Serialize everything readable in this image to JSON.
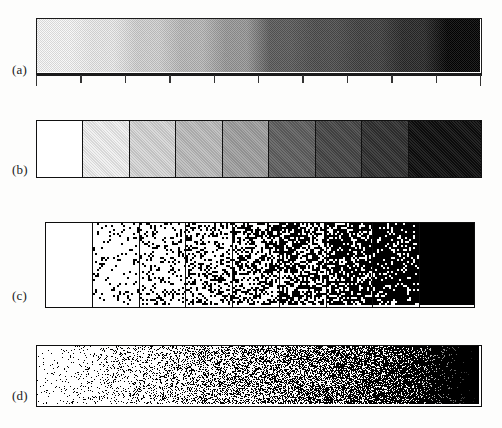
{
  "figure": {
    "kind": "halftone-ramp-comparison",
    "background_color": "#fdfdfc",
    "ink_color": "#0d0d0d",
    "paper_color": "#ffffff",
    "panels": [
      {
        "id": "a",
        "label": "(a)",
        "description": "continuous stepped gray ramp with tick axis",
        "x": 36,
        "y": 18,
        "width": 446,
        "height": 56,
        "has_axis": true,
        "has_cell_borders": false,
        "rendering": "stepped-gray",
        "steps": 10,
        "gray_levels": [
          232,
          222,
          200,
          178,
          150,
          96,
          84,
          72,
          52,
          18
        ],
        "axis": {
          "y_offset": 56,
          "line_thickness": 2,
          "tick_count": 11,
          "tick_length": 8,
          "tick_length_major": 11,
          "major_every": 1
        }
      },
      {
        "id": "b",
        "label": "(b)",
        "description": "nine discrete gray cells with black borders",
        "x": 36,
        "y": 120,
        "width": 446,
        "height": 58,
        "has_axis": false,
        "has_cell_borders": true,
        "rendering": "flat-gray-cells",
        "cells": 9,
        "gray_levels": [
          255,
          240,
          214,
          188,
          160,
          96,
          70,
          48,
          12
        ]
      },
      {
        "id": "c",
        "label": "(c)",
        "description": "random dithered cells of increasing dot density",
        "x": 45,
        "y": 222,
        "width": 430,
        "height": 86,
        "has_axis": false,
        "has_cell_borders": true,
        "rendering": "random-dither-cells",
        "cells": 9,
        "dot_densities": [
          0.0,
          0.11,
          0.22,
          0.34,
          0.46,
          0.58,
          0.7,
          0.85,
          1.0
        ],
        "dot_size": 2
      },
      {
        "id": "d",
        "label": "(d)",
        "description": "continuous random dither gradient, no cell boundaries",
        "x": 36,
        "y": 345,
        "width": 446,
        "height": 62,
        "has_axis": false,
        "has_cell_borders": false,
        "rendering": "random-dither-continuous",
        "density_start": 0.03,
        "density_end": 1.0,
        "dot_size": 1
      }
    ],
    "labels": {
      "a": "(a)",
      "b": "(b)",
      "c": "(c)",
      "d": "(d)"
    },
    "label_positions": [
      {
        "id": "a",
        "x": 12,
        "y": 62
      },
      {
        "id": "b",
        "x": 12,
        "y": 162
      },
      {
        "id": "c",
        "x": 12,
        "y": 288
      },
      {
        "id": "d",
        "x": 12,
        "y": 388
      }
    ]
  },
  "chart_data": {
    "type": "heatmap",
    "title": "",
    "xlabel": "",
    "ylabel": "",
    "series": [
      {
        "name": "(a) stepped gray ramp",
        "categories": [
          "1",
          "2",
          "3",
          "4",
          "5",
          "6",
          "7",
          "8",
          "9",
          "10"
        ],
        "values": [
          232,
          222,
          200,
          178,
          150,
          96,
          84,
          72,
          52,
          18
        ],
        "unit": "gray level (0=black, 255=white)"
      },
      {
        "name": "(b) discrete gray cells",
        "categories": [
          "1",
          "2",
          "3",
          "4",
          "5",
          "6",
          "7",
          "8",
          "9"
        ],
        "values": [
          255,
          240,
          214,
          188,
          160,
          96,
          70,
          48,
          12
        ],
        "unit": "gray level (0=black, 255=white)"
      },
      {
        "name": "(c) dithered cells dot coverage",
        "categories": [
          "1",
          "2",
          "3",
          "4",
          "5",
          "6",
          "7",
          "8",
          "9"
        ],
        "values": [
          0.0,
          0.11,
          0.22,
          0.34,
          0.46,
          0.58,
          0.7,
          0.85,
          1.0
        ],
        "unit": "fractional dot coverage"
      },
      {
        "name": "(d) continuous dither coverage",
        "categories": [
          "left",
          "right"
        ],
        "values": [
          0.03,
          1.0
        ],
        "unit": "fractional dot coverage"
      }
    ],
    "ylim": [
      0,
      255
    ],
    "grid": false,
    "legend_position": "none"
  }
}
